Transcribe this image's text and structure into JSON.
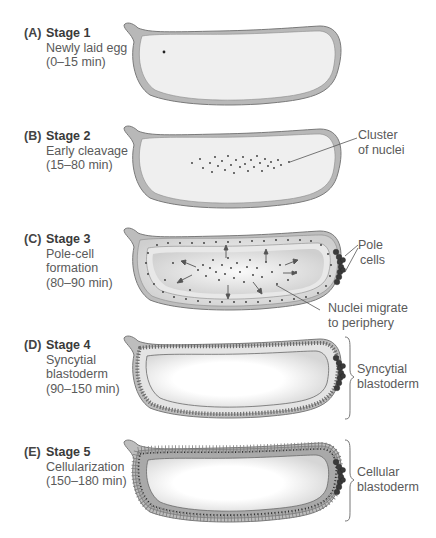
{
  "figure": {
    "stages": [
      {
        "tag": "(A)",
        "title": "Stage 1",
        "lines": [
          "Newly laid egg",
          "(0–15 min)"
        ],
        "callouts": []
      },
      {
        "tag": "(B)",
        "title": "Stage 2",
        "lines": [
          "Early cleavage",
          "(15–80 min)"
        ],
        "callouts": [
          {
            "lines": [
              "Cluster",
              "of nuclei"
            ]
          }
        ]
      },
      {
        "tag": "(C)",
        "title": "Stage 3",
        "lines": [
          "Pole-cell",
          "formation",
          "(80–90 min)"
        ],
        "callouts": [
          {
            "lines": [
              "Pole",
              "cells"
            ]
          },
          {
            "lines": [
              "Nuclei migrate",
              "to periphery"
            ]
          }
        ]
      },
      {
        "tag": "(D)",
        "title": "Stage 4",
        "lines": [
          "Syncytial",
          "blastoderm",
          "(90–150 min)"
        ],
        "callouts": [
          {
            "lines": [
              "Syncytial",
              "blastoderm"
            ]
          }
        ]
      },
      {
        "tag": "(E)",
        "title": "Stage 5",
        "lines": [
          "Cellularization",
          "(150–180 min)"
        ],
        "callouts": [
          {
            "lines": [
              "Cellular",
              "blastoderm"
            ]
          }
        ]
      }
    ],
    "colors": {
      "egg_outline": "#7a7a7a",
      "egg_shell": "#b8b8b8",
      "egg_interior": "#efefef",
      "pole_cells": "#3a3a3a",
      "nuclei": "#333333",
      "leader_line": "#555555"
    }
  }
}
